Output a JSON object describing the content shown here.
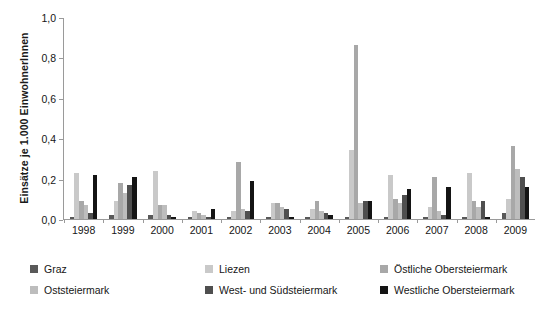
{
  "chart_data": {
    "type": "bar",
    "title": "",
    "xlabel": "",
    "ylabel": "Einsätze je 1.000 EinwohnerInnen",
    "ylim": [
      0.0,
      1.0
    ],
    "ytick_labels": [
      "1,0",
      "0,8",
      "0,6",
      "0,4",
      "0,2",
      "0,0"
    ],
    "ytick_values": [
      1.0,
      0.8,
      0.6,
      0.4,
      0.2,
      0.0
    ],
    "grid": false,
    "legend_position": "below",
    "categories": [
      "1998",
      "1999",
      "2000",
      "2001",
      "2002",
      "2003",
      "2004",
      "2005",
      "2006",
      "2007",
      "2008",
      "2009"
    ],
    "series": [
      {
        "name": "Graz",
        "color": "#595959",
        "values": [
          0.01,
          0.02,
          0.02,
          0.01,
          0.01,
          0.01,
          0.01,
          0.01,
          0.01,
          0.01,
          0.01,
          0.03
        ]
      },
      {
        "name": "Liezen",
        "color": "#c9c9c9",
        "values": [
          0.23,
          0.09,
          0.24,
          0.04,
          0.04,
          0.08,
          0.05,
          0.34,
          0.22,
          0.06,
          0.23,
          0.1
        ]
      },
      {
        "name": "Östliche Obersteiermark",
        "color": "#a8a8a8",
        "values": [
          0.09,
          0.18,
          0.07,
          0.03,
          0.28,
          0.08,
          0.09,
          0.86,
          0.1,
          0.21,
          0.09,
          0.36
        ]
      },
      {
        "name": "Oststeiermark",
        "color": "#bdbdbd",
        "values": [
          0.07,
          0.13,
          0.07,
          0.02,
          0.05,
          0.06,
          0.04,
          0.08,
          0.08,
          0.04,
          0.06,
          0.25
        ]
      },
      {
        "name": "West- und Südsteiermark",
        "color": "#4f4f4f",
        "values": [
          0.03,
          0.17,
          0.02,
          0.01,
          0.04,
          0.05,
          0.03,
          0.09,
          0.12,
          0.02,
          0.09,
          0.21
        ]
      },
      {
        "name": "Westliche Obersteiermark",
        "color": "#141414",
        "values": [
          0.22,
          0.21,
          0.01,
          0.05,
          0.19,
          0.01,
          0.02,
          0.09,
          0.15,
          0.16,
          0.01,
          0.16
        ]
      }
    ]
  },
  "legend": {
    "rows": [
      [
        {
          "label": "Graz",
          "color": "#595959"
        },
        {
          "label": "Liezen",
          "color": "#c9c9c9"
        },
        {
          "label": "Östliche Obersteiermark",
          "color": "#a8a8a8"
        }
      ],
      [
        {
          "label": "Oststeiermark",
          "color": "#bdbdbd"
        },
        {
          "label": "West- und Südsteiermark",
          "color": "#4f4f4f"
        },
        {
          "label": "Westliche Obersteiermark",
          "color": "#141414"
        }
      ]
    ]
  }
}
